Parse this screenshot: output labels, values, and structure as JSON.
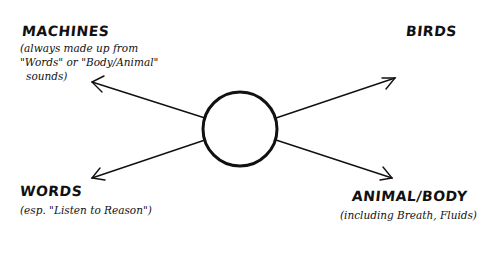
{
  "diagram": {
    "center_node": {
      "shape": "circle",
      "label": ""
    },
    "nodes": [
      {
        "id": "machines",
        "title": "MACHINES",
        "note_lines": [
          "(always made up from",
          "\"Words\" or \"Body/Animal\"",
          "sounds)"
        ]
      },
      {
        "id": "birds",
        "title": "BIRDS",
        "note_lines": []
      },
      {
        "id": "words",
        "title": "WORDS",
        "note_lines": [
          "(esp. \"Listen to Reason\")"
        ]
      },
      {
        "id": "animal_body",
        "title": "ANIMAL/BODY",
        "note_lines": [
          "(including Breath, Fluids)"
        ]
      }
    ],
    "edges": [
      {
        "from": "center",
        "to": "machines"
      },
      {
        "from": "center",
        "to": "birds"
      },
      {
        "from": "center",
        "to": "words"
      },
      {
        "from": "center",
        "to": "animal_body"
      }
    ],
    "colors": {
      "ink": "#111111",
      "background": "#ffffff"
    }
  }
}
